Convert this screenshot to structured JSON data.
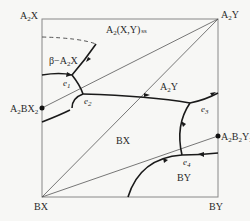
{
  "diagram": {
    "type": "ternary reciprocal phase diagram (liquidus projection)",
    "corners": {
      "top_left": "A2X",
      "top_right": "A2Y",
      "bottom_left": "BX",
      "bottom_right": "BY"
    },
    "compounds": {
      "left_edge": "A2BX2",
      "right_edge": "A2B2Y3"
    },
    "fields": {
      "top": "A2(X,Y) ss",
      "beta": "β−A2X",
      "a2y": "A2Y",
      "bx": "BX",
      "by": "BY"
    },
    "eutectics": [
      "e1",
      "e2",
      "e3",
      "e4"
    ]
  }
}
